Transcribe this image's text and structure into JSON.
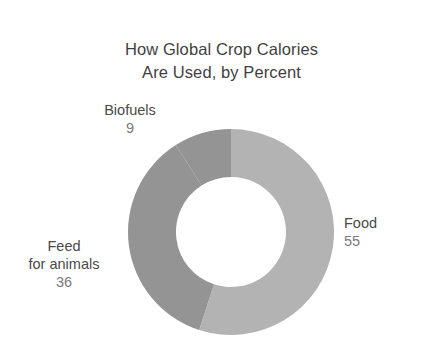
{
  "chart_data": {
    "type": "pie",
    "variant": "donut",
    "title": "How Global Crop Calories Are Used, by Percent",
    "title_lines": [
      "How Global Crop Calories",
      "Are Used, by Percent"
    ],
    "xlabel": "",
    "ylabel": "",
    "units": "percent",
    "total": 100,
    "start_angle_deg": 0,
    "direction": "clockwise",
    "legend_position": "outside-labels",
    "grid": false,
    "categories": [
      "Food",
      "Feed for animals",
      "Biofuels"
    ],
    "values": [
      55,
      36,
      9
    ],
    "slices": [
      {
        "label": "Food",
        "label_lines": [
          "Food"
        ],
        "value": 55,
        "value_text": "55",
        "color": "#b3b3b3"
      },
      {
        "label": "Feed for animals",
        "label_lines": [
          "Feed",
          "for animals"
        ],
        "value": 36,
        "value_text": "36",
        "color": "#949494"
      },
      {
        "label": "Biofuels",
        "label_lines": [
          "Biofuels"
        ],
        "value": 9,
        "value_text": "9",
        "color": "#949494"
      }
    ],
    "colors": {
      "food": "#b3b3b3",
      "feed_for_animals": "#949494",
      "biofuels": "#949494",
      "background": "#ffffff",
      "title_text": "#3f3f3f",
      "label_text": "#4a4a4a",
      "value_text": "#7a7a7a"
    }
  },
  "chart": {
    "title": {
      "line1": "How Global Crop Calories",
      "line2": "Are Used, by Percent"
    },
    "labels": {
      "food": {
        "name": "Food",
        "value": "55"
      },
      "feed": {
        "name_line1": "Feed",
        "name_line2": "for animals",
        "value": "36"
      },
      "biofuels": {
        "name": "Biofuels",
        "value": "9"
      }
    }
  }
}
